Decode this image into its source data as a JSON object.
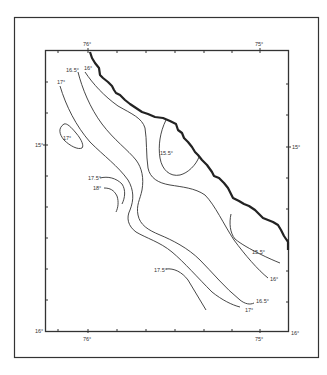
{
  "map": {
    "type": "isotherm contour map",
    "longitude_labels": {
      "top": [
        {
          "text": "76°",
          "x": 88
        },
        {
          "text": "75°",
          "x": 260
        }
      ],
      "bottom": [
        {
          "text": "76°",
          "x": 88
        },
        {
          "text": "75°",
          "x": 260
        }
      ]
    },
    "latitude_labels": {
      "left": [
        {
          "text": "15°",
          "y": 145
        },
        {
          "text": "16°",
          "y": 331
        }
      ],
      "right": [
        {
          "text": "15°",
          "y": 147
        },
        {
          "text": "16°",
          "y": 333
        }
      ]
    },
    "isotherms": [
      {
        "label": "15.5°",
        "x": 160,
        "y": 153
      },
      {
        "label": "15.5°",
        "x": 252,
        "y": 253
      },
      {
        "label": "16°",
        "x": 84,
        "y": 68
      },
      {
        "label": "16°",
        "x": 272,
        "y": 280
      },
      {
        "label": "16.5°",
        "x": 68,
        "y": 70
      },
      {
        "label": "16.5°",
        "x": 256,
        "y": 302
      },
      {
        "label": "17°",
        "x": 59,
        "y": 82
      },
      {
        "label": "17°",
        "x": 63,
        "y": 138
      },
      {
        "label": "17°",
        "x": 246,
        "y": 310
      },
      {
        "label": "17.5°",
        "x": 88,
        "y": 178
      },
      {
        "label": "17.5°",
        "x": 155,
        "y": 271
      },
      {
        "label": "18°",
        "x": 93,
        "y": 188
      }
    ],
    "colors": {
      "line": "#333333",
      "coast": "#222222",
      "background": "#ffffff"
    }
  }
}
